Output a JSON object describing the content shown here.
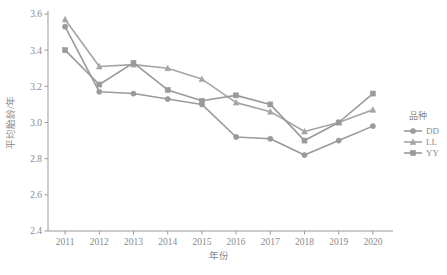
{
  "chart_data": {
    "type": "line",
    "title": "",
    "xlabel": "年份",
    "ylabel": "平均胎龄/年",
    "categories": [
      "2011",
      "2012",
      "2013",
      "2014",
      "2015",
      "2016",
      "2017",
      "2018",
      "2019",
      "2020"
    ],
    "x": [
      2011,
      2012,
      2013,
      2014,
      2015,
      2016,
      2017,
      2018,
      2019,
      2020
    ],
    "xlim": [
      2010.5,
      2020.5
    ],
    "ylim": [
      2.4,
      3.6
    ],
    "yticks": [
      2.4,
      2.6,
      2.8,
      3.0,
      3.2,
      3.4,
      3.6
    ],
    "ytick_labels": [
      "2.4",
      "2.6",
      "2.8",
      "3.0",
      "3.2",
      "3.4",
      "3.6"
    ],
    "xtick_labels": [
      "2011",
      "2012",
      "2013",
      "2014",
      "2015",
      "2016",
      "2017",
      "2018",
      "2019",
      "2020"
    ],
    "grid": false,
    "legend_position": "right",
    "legend_title": "品种",
    "series": [
      {
        "name": "DD",
        "marker": "circle",
        "color": "#9a9a9a",
        "values": [
          3.53,
          3.17,
          3.16,
          3.13,
          3.1,
          2.92,
          2.91,
          2.82,
          2.9,
          2.98
        ]
      },
      {
        "name": "LL",
        "marker": "triangle",
        "color": "#a5a5a5",
        "values": [
          3.57,
          3.31,
          3.32,
          3.3,
          3.24,
          3.11,
          3.06,
          2.95,
          3.0,
          3.07
        ]
      },
      {
        "name": "YY",
        "marker": "square",
        "color": "#9a9a9a",
        "values": [
          3.4,
          3.21,
          3.33,
          3.18,
          3.12,
          3.15,
          3.1,
          2.9,
          3.0,
          3.16
        ]
      }
    ]
  },
  "legend": {
    "title": "品种",
    "items": [
      {
        "label": "DD",
        "marker": "circle-marker-icon"
      },
      {
        "label": "LL",
        "marker": "triangle-marker-icon"
      },
      {
        "label": "YY",
        "marker": "square-marker-icon"
      }
    ]
  },
  "axes": {
    "x_title": "年份",
    "y_title": "平均胎龄/年"
  }
}
